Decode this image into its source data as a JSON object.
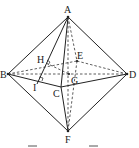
{
  "diagram": {
    "type": "octahedron geometry figure",
    "points": {
      "A": {
        "label": "A",
        "x": 68,
        "y": 17
      },
      "B": {
        "label": "B",
        "x": 8,
        "y": 74
      },
      "C": {
        "label": "C",
        "x": 61,
        "y": 87
      },
      "D": {
        "label": "D",
        "x": 127,
        "y": 74
      },
      "E": {
        "label": "E",
        "x": 77,
        "y": 61
      },
      "F": {
        "label": "F",
        "x": 68,
        "y": 131
      },
      "G": {
        "label": "G",
        "x": 69,
        "y": 74
      },
      "H": {
        "label": "H",
        "x": 46,
        "y": 61
      },
      "I": {
        "label": "I",
        "x": 39,
        "y": 81
      }
    },
    "solid_edges": [
      "AB",
      "AD",
      "BF",
      "DF",
      "AC",
      "CF",
      "BC",
      "CD",
      "AI"
    ],
    "dashed_edges": [
      "BD",
      "BE",
      "ED",
      "AE",
      "EF",
      "AF",
      "HG"
    ],
    "right_angle_marks": [
      "H",
      "I"
    ],
    "caption_marks": [
      "",
      ""
    ]
  }
}
